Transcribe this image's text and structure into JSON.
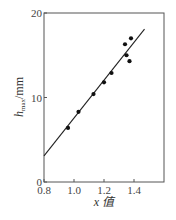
{
  "chart_data": {
    "type": "scatter",
    "title": "",
    "xlabel": "x 值",
    "ylabel_main": "h",
    "ylabel_sub": "max",
    "ylabel_unit": "/mm",
    "xlim": [
      0.8,
      1.6
    ],
    "ylim": [
      0,
      20
    ],
    "x_ticks": [
      "0.8",
      "1.0",
      "1.2",
      "1.4"
    ],
    "y_ticks": [
      "0",
      "10",
      "20"
    ],
    "grid": false,
    "legend": null,
    "series": [
      {
        "name": "measured",
        "type": "scatter",
        "points": [
          {
            "x": 0.96,
            "y": 6.4
          },
          {
            "x": 1.03,
            "y": 8.3
          },
          {
            "x": 1.13,
            "y": 10.4
          },
          {
            "x": 1.2,
            "y": 11.8
          },
          {
            "x": 1.25,
            "y": 12.9
          },
          {
            "x": 1.34,
            "y": 16.3
          },
          {
            "x": 1.38,
            "y": 17.0
          },
          {
            "x": 1.35,
            "y": 15.0
          },
          {
            "x": 1.37,
            "y": 14.3
          }
        ]
      },
      {
        "name": "fit",
        "type": "line",
        "points": [
          {
            "x": 0.8,
            "y": 3.1
          },
          {
            "x": 1.47,
            "y": 18.1
          }
        ]
      }
    ]
  }
}
